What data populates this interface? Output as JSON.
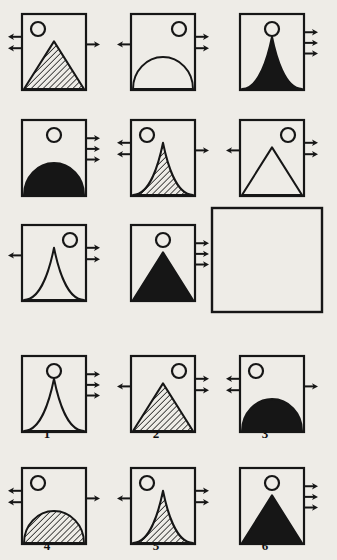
{
  "page": {
    "type": "visual-analogy-puzzle",
    "background_color": "#eeece7",
    "ink_color": "#161616",
    "width": 337,
    "height": 560
  },
  "matrix": {
    "name": "problem-matrix",
    "rows": 3,
    "cols": 3,
    "cells": [
      {
        "id": "cell-1",
        "row": 1,
        "col": 1,
        "x": 22,
        "y": 14,
        "w": 64,
        "h": 76,
        "circle": {
          "pos": "top-left",
          "cx": 16,
          "cy": 15,
          "r": 7
        },
        "shape": "triangle",
        "fill": "hatched",
        "arrows_left": 2,
        "arrows_right": 1
      },
      {
        "id": "cell-2",
        "row": 1,
        "col": 2,
        "x": 131,
        "y": 14,
        "w": 64,
        "h": 76,
        "circle": {
          "pos": "top-right",
          "cx": 48,
          "cy": 15,
          "r": 7
        },
        "shape": "dome",
        "fill": "white",
        "arrows_left": 1,
        "arrows_right": 2
      },
      {
        "id": "cell-3",
        "row": 1,
        "col": 3,
        "x": 240,
        "y": 14,
        "w": 64,
        "h": 76,
        "circle": {
          "pos": "top-center",
          "cx": 32,
          "cy": 15,
          "r": 7
        },
        "shape": "spike",
        "fill": "black",
        "arrows_left": 0,
        "arrows_right": 3
      },
      {
        "id": "cell-4",
        "row": 2,
        "col": 1,
        "x": 22,
        "y": 120,
        "w": 64,
        "h": 76,
        "circle": {
          "pos": "top-center",
          "cx": 32,
          "cy": 15,
          "r": 7
        },
        "shape": "dome",
        "fill": "black",
        "arrows_left": 0,
        "arrows_right": 3
      },
      {
        "id": "cell-5",
        "row": 2,
        "col": 2,
        "x": 131,
        "y": 120,
        "w": 64,
        "h": 76,
        "circle": {
          "pos": "top-left",
          "cx": 16,
          "cy": 15,
          "r": 7
        },
        "shape": "spike",
        "fill": "hatched",
        "arrows_left": 2,
        "arrows_right": 1
      },
      {
        "id": "cell-6",
        "row": 2,
        "col": 3,
        "x": 240,
        "y": 120,
        "w": 64,
        "h": 76,
        "circle": {
          "pos": "top-right",
          "cx": 48,
          "cy": 15,
          "r": 7
        },
        "shape": "triangle",
        "fill": "white",
        "arrows_left": 1,
        "arrows_right": 2
      },
      {
        "id": "cell-7",
        "row": 3,
        "col": 1,
        "x": 22,
        "y": 225,
        "w": 64,
        "h": 76,
        "circle": {
          "pos": "top-right",
          "cx": 48,
          "cy": 15,
          "r": 7
        },
        "shape": "spike",
        "fill": "white",
        "arrows_left": 1,
        "arrows_right": 2
      },
      {
        "id": "cell-8",
        "row": 3,
        "col": 2,
        "x": 131,
        "y": 225,
        "w": 64,
        "h": 76,
        "circle": {
          "pos": "top-center",
          "cx": 32,
          "cy": 15,
          "r": 7
        },
        "shape": "triangle",
        "fill": "black",
        "arrows_left": 0,
        "arrows_right": 3
      },
      {
        "id": "cell-9-blank",
        "row": 3,
        "col": 3,
        "x": 212,
        "y": 208,
        "w": 110,
        "h": 104,
        "circle": null,
        "shape": "none",
        "fill": "none",
        "arrows_left": 0,
        "arrows_right": 0,
        "is_answer_blank": true
      }
    ]
  },
  "options": {
    "name": "answer-options",
    "items": [
      {
        "id": "option-1",
        "label": "1",
        "x": 22,
        "y": 356,
        "w": 64,
        "h": 76,
        "label_x": 47,
        "label_y": 436,
        "circle": {
          "pos": "top-center",
          "cx": 32,
          "cy": 15,
          "r": 7
        },
        "shape": "spike",
        "fill": "white",
        "arrows_left": 0,
        "arrows_right": 3
      },
      {
        "id": "option-2",
        "label": "2",
        "x": 131,
        "y": 356,
        "w": 64,
        "h": 76,
        "label_x": 156,
        "label_y": 436,
        "circle": {
          "pos": "top-right",
          "cx": 48,
          "cy": 15,
          "r": 7
        },
        "shape": "triangle",
        "fill": "hatched",
        "arrows_left": 1,
        "arrows_right": 2
      },
      {
        "id": "option-3",
        "label": "3",
        "x": 240,
        "y": 356,
        "w": 64,
        "h": 76,
        "label_x": 265,
        "label_y": 436,
        "circle": {
          "pos": "top-left",
          "cx": 16,
          "cy": 15,
          "r": 7
        },
        "shape": "dome",
        "fill": "black",
        "arrows_left": 2,
        "arrows_right": 1
      },
      {
        "id": "option-4",
        "label": "4",
        "x": 22,
        "y": 468,
        "w": 64,
        "h": 76,
        "label_x": 47,
        "label_y": 548,
        "circle": {
          "pos": "top-left",
          "cx": 16,
          "cy": 15,
          "r": 7
        },
        "shape": "dome",
        "fill": "hatched",
        "arrows_left": 2,
        "arrows_right": 1
      },
      {
        "id": "option-5",
        "label": "5",
        "x": 131,
        "y": 468,
        "w": 64,
        "h": 76,
        "label_x": 156,
        "label_y": 548,
        "circle": {
          "pos": "top-left",
          "cx": 16,
          "cy": 15,
          "r": 7
        },
        "shape": "spike",
        "fill": "hatched",
        "arrows_left": 1,
        "arrows_right": 2
      },
      {
        "id": "option-6",
        "label": "6",
        "x": 240,
        "y": 468,
        "w": 64,
        "h": 76,
        "label_x": 265,
        "label_y": 548,
        "circle": {
          "pos": "top-center",
          "cx": 32,
          "cy": 15,
          "r": 7
        },
        "shape": "triangle",
        "fill": "black",
        "arrows_left": 0,
        "arrows_right": 3
      }
    ]
  }
}
